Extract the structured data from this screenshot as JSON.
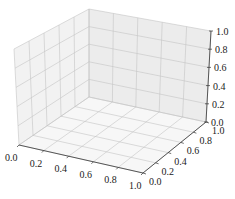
{
  "chart_data": {
    "type": "scatter3d",
    "title": "",
    "xlabel": "",
    "ylabel": "",
    "zlabel": "",
    "x_ticks": [
      "0.0",
      "0.2",
      "0.4",
      "0.6",
      "0.8",
      "1.0"
    ],
    "y_ticks": [
      "0.0",
      "0.2",
      "0.4",
      "0.6",
      "0.8",
      "1.0"
    ],
    "z_ticks": [
      "0.0",
      "0.2",
      "0.4",
      "0.6",
      "0.8",
      "1.0"
    ],
    "xlim": [
      0,
      1
    ],
    "ylim": [
      0,
      1
    ],
    "zlim": [
      0,
      1
    ],
    "grid": true,
    "series": [],
    "legend": null
  }
}
